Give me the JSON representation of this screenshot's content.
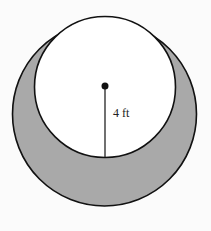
{
  "diagram": {
    "type": "shaded-region-between-circles",
    "outer_circle": {
      "cx": 104.5,
      "cy": 114,
      "r": 92
    },
    "inner_circle": {
      "cx": 105,
      "cy": 87,
      "r": 70.5
    },
    "center_point": {
      "cx": 105,
      "cy": 86
    },
    "radius_line": {
      "x1": 105,
      "y1": 86,
      "x2": 105,
      "y2": 157.5
    },
    "radius_label": "4 ft",
    "colors": {
      "shaded": "#a9a9a9",
      "inner": "#ffffff",
      "stroke": "#111111",
      "background": "#fbfbfb"
    }
  }
}
